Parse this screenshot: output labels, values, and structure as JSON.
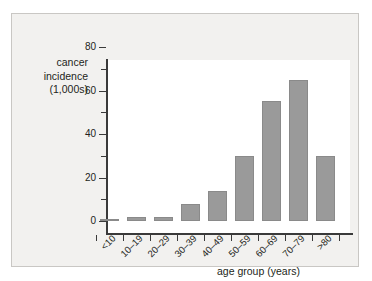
{
  "chart_data": {
    "type": "bar",
    "title": "",
    "categories": [
      "<10",
      "10–19",
      "20–29",
      "30–39",
      "40–49",
      "50–59",
      "60–69",
      "70–79",
      ">80"
    ],
    "values": [
      1,
      2,
      2,
      8,
      14,
      30,
      55,
      65,
      30
    ],
    "xlabel": "age group (years)",
    "ylabel": "cancer incidence (1,000s)",
    "ylabel_lines": [
      "cancer",
      "incidence",
      "(1,000s)"
    ],
    "ylim": [
      0,
      80
    ],
    "yticks": [
      0,
      20,
      40,
      60,
      80
    ],
    "ytick_labels": [
      "0",
      "20",
      "40",
      "60",
      "80"
    ],
    "yminor_ticks": [
      10,
      30,
      50,
      70
    ],
    "grid": false,
    "legend": false,
    "bar_color": "#9a9a9a",
    "bar_edge_color": "#8a8a8a",
    "axis_color": "#3a3a3a",
    "panel_color": "#f2f1ef",
    "plot_background": "#ffffff"
  }
}
